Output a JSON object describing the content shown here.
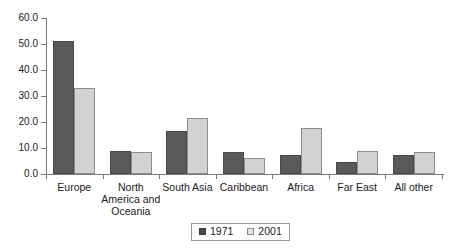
{
  "chart_data": {
    "type": "bar",
    "title": "",
    "subtitle": "",
    "xlabel": "",
    "ylabel": "",
    "ylim": [
      0,
      60
    ],
    "ytick_step": 10,
    "grid": false,
    "legend_position": "bottom-center",
    "categories": [
      "Europe",
      "North America and Oceania",
      "South Asia",
      "Caribbean",
      "Africa",
      "Far East",
      "All other"
    ],
    "category_label_lines": [
      [
        "Europe"
      ],
      [
        "North",
        "America and",
        "Oceania"
      ],
      [
        "South Asia"
      ],
      [
        "Caribbean"
      ],
      [
        "Africa"
      ],
      [
        "Far East"
      ],
      [
        "All other"
      ]
    ],
    "ytick_labels": [
      "0.0",
      "10.0",
      "20.0",
      "30.0",
      "40.0",
      "50.0",
      "60.0"
    ],
    "ytick_values": [
      0,
      10,
      20,
      30,
      40,
      50,
      60
    ],
    "series": [
      {
        "name": "1971",
        "color": "#595959",
        "values": [
          51.0,
          8.7,
          16.5,
          8.5,
          7.5,
          4.5,
          7.3
        ]
      },
      {
        "name": "2001",
        "color": "#d2d2d2",
        "values": [
          33.2,
          8.5,
          21.5,
          6.0,
          17.7,
          9.0,
          8.3
        ]
      }
    ]
  },
  "legend": {
    "items": [
      {
        "label": "1971"
      },
      {
        "label": "2001"
      }
    ]
  },
  "colors": {
    "series_1971": "#595959",
    "series_2001": "#d2d2d2",
    "axis": "#7a7a7a",
    "text": "#1a1a1a",
    "background": "#ffffff"
  }
}
